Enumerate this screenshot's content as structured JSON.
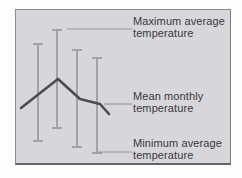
{
  "diagram": {
    "type": "range-bar-diagram",
    "background_color": "#d7d6da",
    "outer_background": "#fdfdfd",
    "bar_color": "#a2a1a6",
    "mean_line_color": "#4c4b50",
    "leader_color": "#98979c",
    "border_color": "#8b8a8f",
    "text_color": "#3a393e",
    "cap_half_width": 5,
    "bars": [
      {
        "x": 22,
        "top": 34,
        "bottom": 131
      },
      {
        "x": 41,
        "top": 20,
        "bottom": 118
      },
      {
        "x": 61,
        "top": 40,
        "bottom": 137
      },
      {
        "x": 81,
        "top": 48,
        "bottom": 143
      }
    ],
    "mean_line_points": "5,98 42,69 64,89 84,94 93,104",
    "labels": [
      {
        "id": "maximum-average-temperature",
        "lines": [
          "Maximum average",
          "temperature"
        ],
        "top_px": 16,
        "leader": {
          "x1": 51,
          "y1": 19,
          "x2": 116
        }
      },
      {
        "id": "mean-monthly-temperature",
        "lines": [
          "Mean monthly",
          "temperature"
        ],
        "top_px": 91,
        "leader": {
          "x1": 88,
          "y1": 94,
          "x2": 116
        }
      },
      {
        "id": "minimum-average-temperature",
        "lines": [
          "Minimum average",
          "temperature"
        ],
        "top_px": 138,
        "leader": {
          "x1": 82,
          "y1": 142,
          "x2": 116
        }
      }
    ]
  }
}
